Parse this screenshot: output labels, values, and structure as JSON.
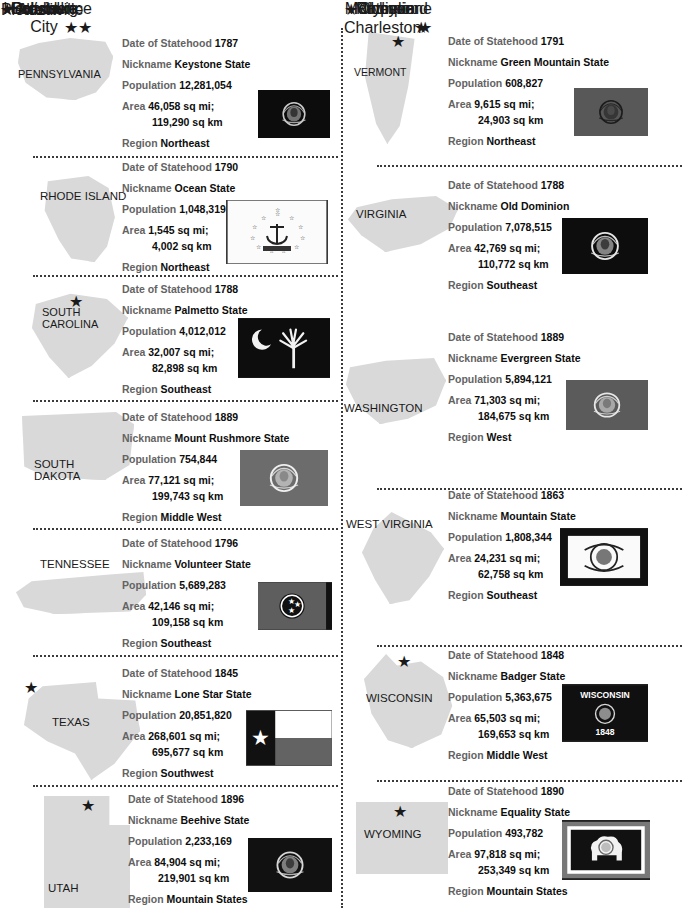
{
  "labels": {
    "date": "Date of Statehood",
    "nickname": "Nickname",
    "population": "Population",
    "area": "Area",
    "region": "Region"
  },
  "colors": {
    "label_gray": "#636363",
    "value_black": "#0d0d0d",
    "map_fill": "#d9d9d9",
    "divider": "#3b3b3b",
    "page_bg": "#ffffff"
  },
  "columns": {
    "left": [
      {
        "state": "PENNSYLVANIA",
        "capital": "Harrisburg",
        "capital_star": "★",
        "date": "1787",
        "nickname": "Keystone State",
        "population": "12,281,054",
        "area_mi": "46,058 sq mi;",
        "area_km": "119,290 sq km",
        "region": "Northeast",
        "flag": "pennsylvania-flag"
      },
      {
        "state": "RHODE ISLAND",
        "capital": "Providence",
        "capital_star": "★",
        "date": "1790",
        "nickname": "Ocean State",
        "population": "1,048,319",
        "area_mi": "1,545 sq mi;",
        "area_km": "4,002 sq km",
        "region": "Northeast",
        "flag": "rhode-island-flag"
      },
      {
        "state": "SOUTH CAROLINA",
        "capital": "Columbia",
        "capital_star": "★",
        "date": "1788",
        "nickname": "Palmetto State",
        "population": "4,012,012",
        "area_mi": "32,007 sq mi;",
        "area_km": "82,898 sq km",
        "region": "Southeast",
        "flag": "south-carolina-flag"
      },
      {
        "state": "SOUTH DAKOTA",
        "capital": "Pierre",
        "capital_star": "★",
        "date": "1889",
        "nickname": "Mount Rushmore State",
        "population": "754,844",
        "area_mi": "77,121 sq mi;",
        "area_km": "199,743 sq km",
        "region": "Middle West",
        "flag": "south-dakota-flag"
      },
      {
        "state": "TENNESSEE",
        "capital": "Nashville",
        "capital_star": "★",
        "date": "1796",
        "nickname": "Volunteer State",
        "population": "5,689,283",
        "area_mi": "42,146 sq mi;",
        "area_km": "109,158 sq km",
        "region": "Southeast",
        "flag": "tennessee-flag"
      },
      {
        "state": "TEXAS",
        "capital": "Austin",
        "capital_star": "★",
        "date": "1845",
        "nickname": "Lone Star State",
        "population": "20,851,820",
        "area_mi": "268,601 sq mi;",
        "area_km": "695,677 sq km",
        "region": "Southwest",
        "flag": "texas-flag"
      },
      {
        "state": "UTAH",
        "capital": "Salt Lake City",
        "capital_star": "★",
        "date": "1896",
        "nickname": "Beehive State",
        "population": "2,233,169",
        "area_mi": "84,904 sq mi;",
        "area_km": "219,901 sq km",
        "region": "Mountain States",
        "flag": "utah-flag"
      }
    ],
    "right": [
      {
        "state": "VERMONT",
        "capital": "Montpelier",
        "capital_star": "★",
        "date": "1791",
        "nickname": "Green Mountain State",
        "population": "608,827",
        "area_mi": "9,615 sq mi;",
        "area_km": "24,903 sq km",
        "region": "Northeast",
        "flag": "vermont-flag"
      },
      {
        "state": "VIRGINIA",
        "capital": "Richmond",
        "capital_star": "★",
        "date": "1788",
        "nickname": "Old Dominion",
        "population": "7,078,515",
        "area_mi": "42,769 sq mi;",
        "area_km": "110,772 sq km",
        "region": "Southeast",
        "flag": "virginia-flag"
      },
      {
        "state": "WASHINGTON",
        "capital": "Olympia",
        "capital_star": "★",
        "date": "1889",
        "nickname": "Evergreen State",
        "population": "5,894,121",
        "area_mi": "71,303 sq mi;",
        "area_km": "184,675 sq km",
        "region": "West",
        "flag": "washington-flag"
      },
      {
        "state": "WEST VIRGINIA",
        "capital": "Charleston",
        "capital_star": "★",
        "date": "1863",
        "nickname": "Mountain State",
        "population": "1,808,344",
        "area_mi": "24,231 sq mi;",
        "area_km": "62,758 sq km",
        "region": "Southeast",
        "flag": "west-virginia-flag"
      },
      {
        "state": "WISCONSIN",
        "capital": "Madison",
        "capital_star": "★",
        "date": "1848",
        "nickname": "Badger State",
        "population": "5,363,675",
        "area_mi": "65,503 sq mi;",
        "area_km": "169,653 sq km",
        "region": "Middle West",
        "flag": "wisconsin-flag",
        "flag_text_top": "WISCONSIN",
        "flag_text_bottom": "1848"
      },
      {
        "state": "WYOMING",
        "capital": "Cheyenne",
        "capital_star": "★",
        "date": "1890",
        "nickname": "Equality State",
        "population": "493,782",
        "area_mi": "97,818 sq mi;",
        "area_km": "253,349 sq km",
        "region": "Mountain States",
        "flag": "wyoming-flag"
      }
    ]
  }
}
